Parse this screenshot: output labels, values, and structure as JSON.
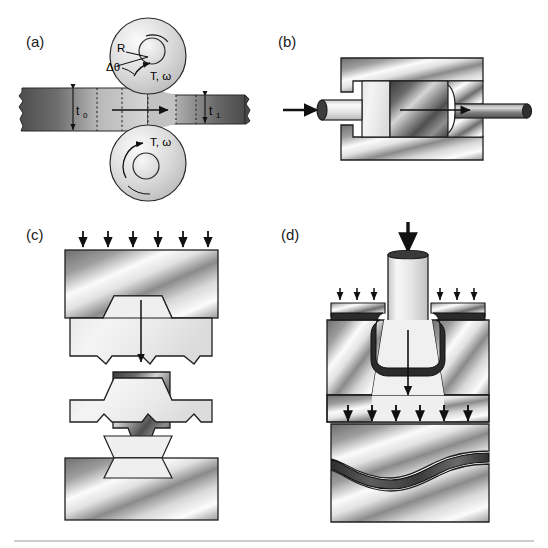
{
  "figure": {
    "panels": [
      {
        "id": "a",
        "label": "(a)",
        "process": "rolling",
        "annotations": {
          "roll_radius": "R",
          "bite_angle": "Δθ",
          "torque_speed_top": "T, ω",
          "torque_speed_bottom": "T, ω",
          "entry_thickness": "t",
          "entry_thickness_sub": "0",
          "exit_thickness": "t",
          "exit_thickness_sub": "1"
        }
      },
      {
        "id": "b",
        "label": "(b)",
        "process": "extrusion",
        "annotations": {}
      },
      {
        "id": "c",
        "label": "(c)",
        "process": "closed-die-forging",
        "annotations": {
          "load_arrow_count": 6
        }
      },
      {
        "id": "d",
        "label": "(d)",
        "process": "deep-drawing-and-sheet-stamping",
        "annotations": {
          "punch_arrow_count": 1,
          "blank_holder_arrow_count_left": 3,
          "blank_holder_arrow_count_right": 3,
          "stamping_arrow_count": 6
        }
      }
    ],
    "colors": {
      "outline": "#1a1a1a",
      "metal_light": "#f2f2f2",
      "metal_mid": "#b8b8b8",
      "metal_dark": "#4a4a4a",
      "workpiece_dark": "#6b6b6b",
      "background": "#ffffff",
      "footer_rule": "#bbbbbb"
    }
  }
}
